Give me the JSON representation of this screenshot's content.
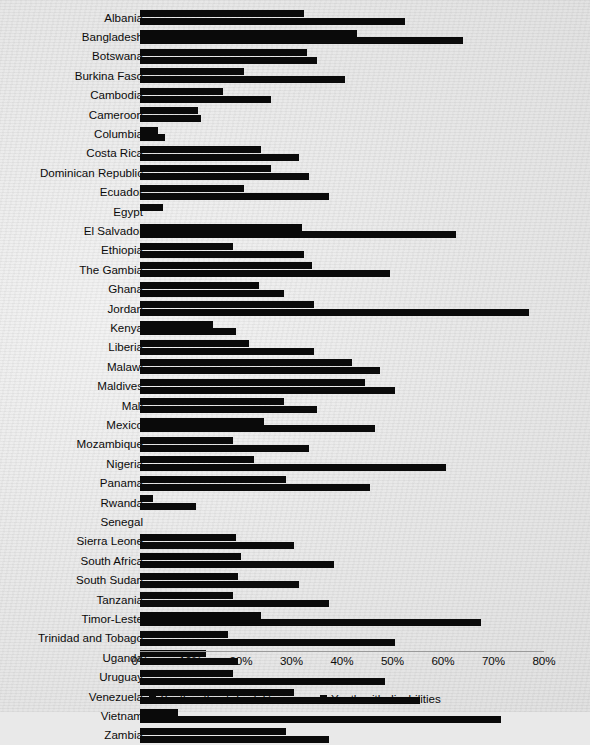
{
  "chart_data": {
    "type": "bar",
    "orientation": "horizontal",
    "title": "",
    "subtitle": "",
    "xlabel": "",
    "ylabel": "",
    "xlim": [
      0,
      80
    ],
    "xunit": "%",
    "grid": false,
    "legend_position": "bottom",
    "xtick_labels": [
      "0%",
      "10%",
      "20%",
      "30%",
      "40%",
      "50%",
      "60%",
      "70%",
      "80%"
    ],
    "xtick_values": [
      0,
      10,
      20,
      30,
      40,
      50,
      60,
      70,
      80
    ],
    "categories": [
      "Albania",
      "Bangladesh",
      "Botswana",
      "Burkina Faso",
      "Cambodia",
      "Cameroon",
      "Columbia",
      "Costa Rica",
      "Dominican Republic",
      "Ecuador",
      "Egypt",
      "El Salvador",
      "Ethiopia",
      "The Gambia",
      "Ghana",
      "Jordan",
      "Kenya",
      "Liberia",
      "Malawi",
      "Maldives",
      "Mali",
      "Mexico",
      "Mozambique",
      "Nigeria",
      "Panama",
      "Rwanda",
      "Senegal",
      "Sierra Leone",
      "South Africa",
      "South Sudan",
      "Tanzania",
      "Timor-Leste",
      "Trinidad and Tobago",
      "Uganda",
      "Uruguay",
      "Venezuela",
      "Vietnam",
      "Zambia"
    ],
    "series": [
      {
        "name": "Youth without disabilities",
        "color": "#0a0a0a",
        "values": [
          32.5,
          43.0,
          33.0,
          20.5,
          16.5,
          11.5,
          3.5,
          24.0,
          26.0,
          20.5,
          4.5,
          32.0,
          18.5,
          34.0,
          23.5,
          34.5,
          14.5,
          21.5,
          42.0,
          44.5,
          28.5,
          24.5,
          18.5,
          22.5,
          29.0,
          2.5,
          0.0,
          19.0,
          20.0,
          19.5,
          18.5,
          24.0,
          17.5,
          13.0,
          18.5,
          30.5,
          7.5,
          29.0
        ]
      },
      {
        "name": "Youth with disabilities",
        "color": "#0a0a0a",
        "values": [
          52.5,
          64.0,
          35.0,
          40.5,
          26.0,
          12.0,
          5.0,
          31.5,
          33.5,
          37.5,
          0.0,
          62.5,
          32.5,
          49.5,
          28.5,
          77.0,
          19.0,
          34.5,
          47.5,
          50.5,
          35.0,
          46.5,
          33.5,
          60.5,
          45.5,
          11.0,
          0.0,
          30.5,
          38.5,
          31.5,
          37.5,
          67.5,
          50.5,
          19.5,
          48.5,
          55.5,
          71.5,
          37.5
        ]
      }
    ]
  },
  "legend": {
    "items": [
      {
        "label": "Youth without disabilities"
      },
      {
        "label": "Youth with disabilities"
      }
    ]
  }
}
